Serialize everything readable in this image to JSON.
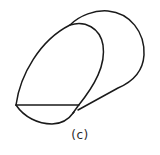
{
  "figure": {
    "caption": "(c)",
    "stroke_color": "#1a1a1a",
    "background": "#ffffff"
  }
}
